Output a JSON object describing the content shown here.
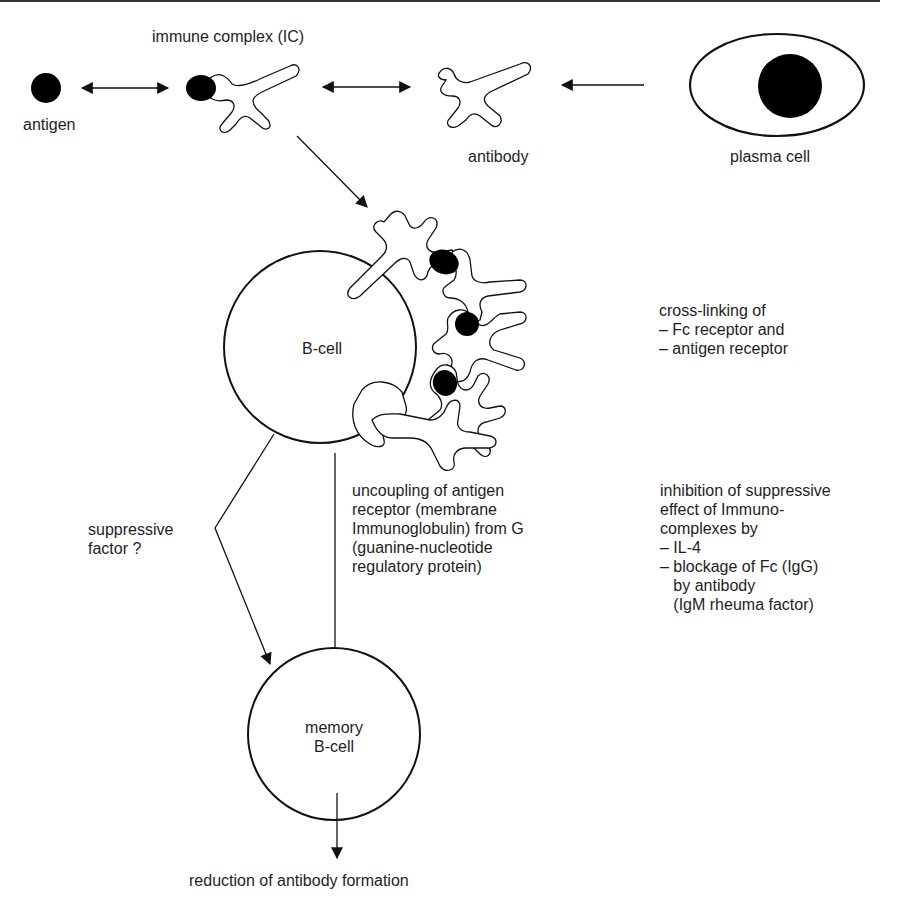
{
  "diagram": {
    "colors": {
      "stroke": "#111111",
      "fill_dark": "#000000",
      "background": "#ffffff",
      "text": "#1e1e1e"
    },
    "nodes": {
      "antigen": {
        "label": "antigen"
      },
      "immune_complex": {
        "label": "immune complex (IC)"
      },
      "antibody": {
        "label": "antibody"
      },
      "plasma_cell": {
        "label": "plasma cell"
      },
      "b_cell": {
        "label": "B-cell"
      },
      "memory_b_cell": {
        "label_line1": "memory",
        "label_line2": "B-cell"
      },
      "outcome": {
        "label": "reduction of antibody formation"
      }
    },
    "annotations": {
      "cross_linking": {
        "lines": [
          "cross-linking of",
          "– Fc receptor and",
          "– antigen receptor"
        ]
      },
      "uncoupling": {
        "lines": [
          "uncoupling of antigen",
          "receptor (membrane",
          "Immunoglobulin) from G",
          "(guanine-nucleotide",
          "regulatory protein)"
        ]
      },
      "inhibition": {
        "lines": [
          "inhibition of suppressive",
          "effect of Immuno-",
          "complexes by",
          "– IL-4",
          "– blockage of Fc (IgG)",
          "   by antibody",
          "   (IgM rheuma factor)"
        ]
      },
      "suppressive_factor": {
        "lines": [
          "suppressive",
          "factor ?"
        ]
      }
    },
    "edges": [
      {
        "from": "antigen",
        "to": "immune_complex",
        "type": "bidirectional"
      },
      {
        "from": "immune_complex",
        "to": "antibody",
        "type": "bidirectional"
      },
      {
        "from": "plasma_cell",
        "to": "antibody",
        "type": "directed"
      },
      {
        "from": "immune_complex",
        "to": "b_cell",
        "type": "directed"
      },
      {
        "from": "b_cell",
        "to": "memory_b_cell",
        "type": "directed",
        "via": "suppressive_factor"
      },
      {
        "from": "b_cell",
        "to": "memory_b_cell",
        "type": "directed",
        "via": "uncoupling"
      },
      {
        "from": "memory_b_cell",
        "to": "outcome",
        "type": "directed"
      }
    ]
  }
}
